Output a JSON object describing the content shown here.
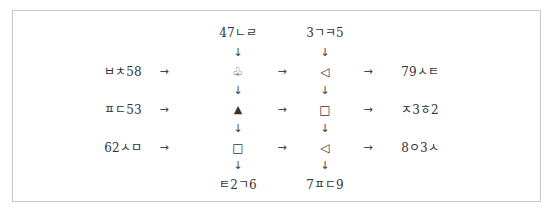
{
  "diagram": {
    "top_inputs": [
      "47ㄴㄹ",
      "3ㄱㅋ5"
    ],
    "bottom_outputs": [
      "ㅌ2ㄱ6",
      "7ㅍㄷ9"
    ],
    "rows": [
      {
        "left": "ㅂㅊ58",
        "symbols": [
          "♧",
          "◁"
        ],
        "right": "79ㅅㅌ"
      },
      {
        "left": "ㅍㄷ53",
        "symbols": [
          "▲",
          "□"
        ],
        "right": "ㅈ3ㅎ2"
      },
      {
        "left": "62ㅅㅁ",
        "symbols": [
          "□",
          "◁"
        ],
        "right": "8ㅇ3ㅅ"
      }
    ],
    "arrows": {
      "right": "→",
      "down": "↓"
    }
  }
}
